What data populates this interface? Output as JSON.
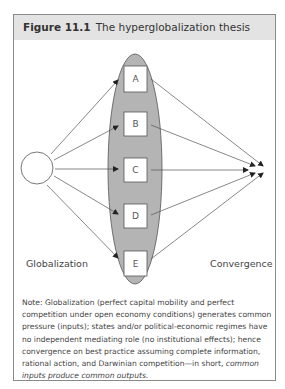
{
  "figure": {
    "number": "Figure 11.1",
    "title": "The hyperglobalization thesis"
  },
  "diagram": {
    "source_label": "Globalization",
    "target_label": "Convergence",
    "boxes": [
      "A",
      "B",
      "C",
      "D",
      "E"
    ],
    "colors": {
      "ellipse_fill": "#b4b4b4",
      "line": "#555555",
      "header_bg": "#e3e3e3"
    }
  },
  "note": {
    "prefix": "Note:",
    "body": "Globalization (perfect capital mobility and perfect competition under open economy conditions) generates common pressure (inputs); states and/or political-economic regimes have no independent mediating role (no institutional effects); hence convergence on best practice assuming complete information, rational action, and Darwinian competition—in short,",
    "emphasis": "common inputs produce common outputs."
  }
}
